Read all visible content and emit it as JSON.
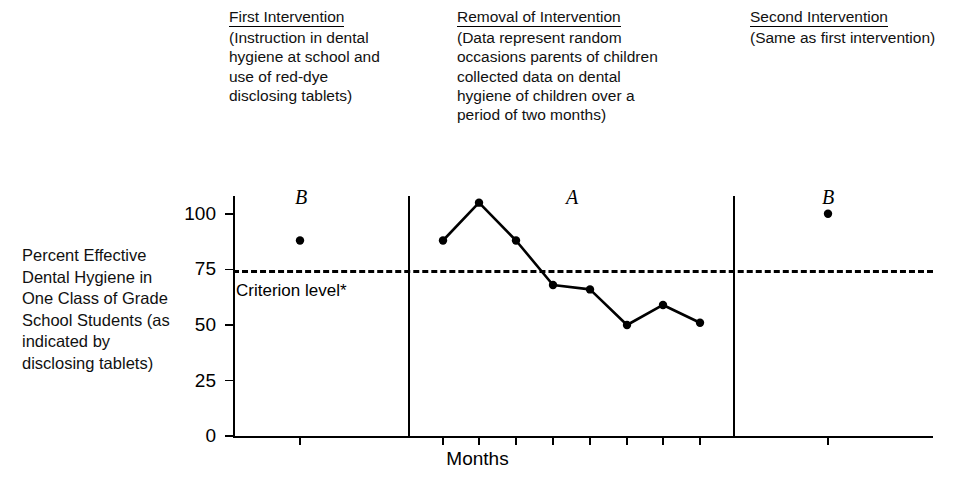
{
  "phase_notes": [
    {
      "id": "first-intervention",
      "title": "First Intervention",
      "body": "(Instruction in dental hygiene at school and use of red-dye disclosing tablets)"
    },
    {
      "id": "removal-of-intervention",
      "title": "Removal of Intervention",
      "body": "(Data represent random occasions parents of children collected data on dental hygiene of children over a period of two months)"
    },
    {
      "id": "second-intervention",
      "title": "Second Intervention",
      "body": "(Same as first intervention)"
    }
  ],
  "phase_letters": [
    {
      "id": "b1",
      "label": "B"
    },
    {
      "id": "a",
      "label": "A"
    },
    {
      "id": "b2",
      "label": "B"
    }
  ],
  "criterion": {
    "label": "Criterion level*",
    "value": 75
  },
  "chart_data": {
    "type": "line",
    "title": "",
    "xlabel": "Months",
    "ylabel": "Percent Effective Dental Hygiene in One Class of Grade School Students (as indicated by disclosing tablets)",
    "ylim": [
      0,
      108
    ],
    "yticks": [
      0,
      25,
      50,
      75,
      100
    ],
    "ytick_labels": [
      "0",
      "25",
      "50",
      "75",
      "100"
    ],
    "grid": false,
    "legend_position": "none",
    "annotations": [
      {
        "text": "Criterion level*",
        "y": 75,
        "style": "dashed-reference-line"
      },
      {
        "text": "B",
        "phase": 1
      },
      {
        "text": "A",
        "phase": 2
      },
      {
        "text": "B",
        "phase": 3
      }
    ],
    "phases": [
      {
        "name": "B",
        "description": "First Intervention",
        "connected": false,
        "points": [
          {
            "x": 1,
            "y": 88
          }
        ]
      },
      {
        "name": "A",
        "description": "Removal of Intervention",
        "connected": true,
        "points": [
          {
            "x": 2,
            "y": 88
          },
          {
            "x": 3,
            "y": 105
          },
          {
            "x": 4,
            "y": 88
          },
          {
            "x": 5,
            "y": 68
          },
          {
            "x": 6,
            "y": 66
          },
          {
            "x": 7,
            "y": 50
          },
          {
            "x": 8,
            "y": 59
          },
          {
            "x": 9,
            "y": 51
          }
        ]
      },
      {
        "name": "B",
        "description": "Second Intervention",
        "connected": false,
        "points": [
          {
            "x": 10,
            "y": 100
          }
        ]
      }
    ],
    "series": [
      {
        "name": "Percent effective dental hygiene",
        "values": [
          88,
          88,
          105,
          88,
          68,
          66,
          50,
          59,
          51,
          100
        ]
      }
    ]
  },
  "axes": {
    "x_title": "Months",
    "y_title": "Percent Effective Dental Hygiene in One Class of Grade School Students (as indicated by disclosing tablets)"
  },
  "colors": {
    "ink": "#000000",
    "background": "#ffffff"
  }
}
